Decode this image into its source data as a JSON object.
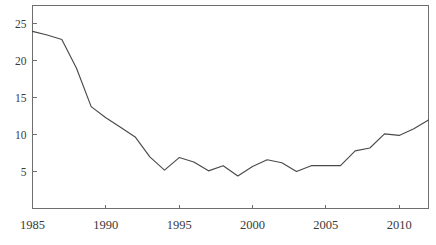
{
  "chart_data": {
    "type": "line",
    "title": "",
    "subtitle": "",
    "xlabel": "",
    "ylabel": "",
    "xlim": [
      1985,
      2012
    ],
    "ylim": [
      0,
      27.5
    ],
    "grid": false,
    "legend": false,
    "legend_position": "none",
    "xticks": [
      1985,
      1990,
      1995,
      2000,
      2005,
      2010
    ],
    "xtick_labels": [
      "1985",
      "1990",
      "1995",
      "2000",
      "2005",
      "2010"
    ],
    "yticks": [
      5,
      10,
      15,
      20,
      25
    ],
    "ytick_labels": [
      "5",
      "10",
      "15",
      "20",
      "25"
    ],
    "line_color": "#4a4a4a",
    "axis_color": "#6e6e6e",
    "background_color": "#ffffff",
    "x": [
      1985,
      1986,
      1987,
      1988,
      1989,
      1990,
      1991,
      1992,
      1993,
      1994,
      1995,
      1996,
      1997,
      1998,
      1999,
      2000,
      2001,
      2002,
      2003,
      2004,
      2005,
      2006,
      2007,
      2008,
      2009,
      2010,
      2011,
      2012
    ],
    "values": [
      24.0,
      23.5,
      22.9,
      19.0,
      13.8,
      12.3,
      11.0,
      9.7,
      7.0,
      5.2,
      6.9,
      6.3,
      5.1,
      5.8,
      4.4,
      5.7,
      6.6,
      6.2,
      5.0,
      5.8,
      5.8,
      5.8,
      7.8,
      8.2,
      10.1,
      9.9,
      10.8,
      12.0
    ],
    "series": [
      {
        "name": "series-1",
        "values": [
          24.0,
          23.5,
          22.9,
          19.0,
          13.8,
          12.3,
          11.0,
          9.7,
          7.0,
          5.2,
          6.9,
          6.3,
          5.1,
          5.8,
          4.4,
          5.7,
          6.6,
          6.2,
          5.0,
          5.8,
          5.8,
          5.8,
          7.8,
          8.2,
          10.1,
          9.9,
          10.8,
          12.0
        ]
      }
    ]
  }
}
